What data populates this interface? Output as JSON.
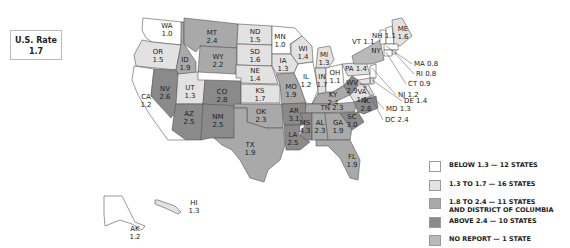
{
  "us_rate": {
    "label": "U.S. Rate",
    "value": "1.7"
  },
  "colors": {
    "below": "#ffffff",
    "low": "#e2e2e2",
    "mid": "#a9a9a9",
    "high": "#8a8a8a",
    "noreport": "#b9b9b9"
  },
  "legend": [
    {
      "key": "below",
      "label": "BELOW 1.3 — 12 STATES"
    },
    {
      "key": "low",
      "label": "1.3 TO 1.7 — 16 STATES"
    },
    {
      "key": "mid",
      "label": "1.8 TO 2.4 — 11 STATES",
      "label2": "AND DISTRICT OF COLUMBIA"
    },
    {
      "key": "high",
      "label": "ABOVE 2.4 — 10 STATES"
    },
    {
      "key": "noreport",
      "label": "NO REPORT — 1 STATE"
    }
  ],
  "states": [
    {
      "abbr": "WA",
      "value": "1.0",
      "cls": "below"
    },
    {
      "abbr": "OR",
      "value": "1.5",
      "cls": "low"
    },
    {
      "abbr": "CA",
      "value": "1.2",
      "cls": "below"
    },
    {
      "abbr": "ID",
      "value": "1.9",
      "cls": "mid"
    },
    {
      "abbr": "NV",
      "value": "2.6",
      "cls": "high"
    },
    {
      "abbr": "MT",
      "value": "2.4",
      "cls": "mid"
    },
    {
      "abbr": "WY",
      "value": "2.2",
      "cls": "mid"
    },
    {
      "abbr": "UT",
      "value": "1.3",
      "cls": "low"
    },
    {
      "abbr": "AZ",
      "value": "2.5",
      "cls": "high"
    },
    {
      "abbr": "CO",
      "value": "2.8",
      "cls": "high"
    },
    {
      "abbr": "NM",
      "value": "2.5",
      "cls": "high"
    },
    {
      "abbr": "ND",
      "value": "1.5",
      "cls": "low"
    },
    {
      "abbr": "SD",
      "value": "1.6",
      "cls": "low"
    },
    {
      "abbr": "NE",
      "value": "1.4",
      "cls": "low"
    },
    {
      "abbr": "KS",
      "value": "1.7",
      "cls": "low"
    },
    {
      "abbr": "OK",
      "value": "2.3",
      "cls": "mid"
    },
    {
      "abbr": "TX",
      "value": "1.9",
      "cls": "mid"
    },
    {
      "abbr": "MN",
      "value": "1.0",
      "cls": "below"
    },
    {
      "abbr": "IA",
      "value": "1.3",
      "cls": "low"
    },
    {
      "abbr": "MO",
      "value": "1.9",
      "cls": "mid"
    },
    {
      "abbr": "AR",
      "value": "3.1",
      "cls": "high"
    },
    {
      "abbr": "LA",
      "value": "2.5",
      "cls": "high"
    },
    {
      "abbr": "WI",
      "value": "1.4",
      "cls": "low"
    },
    {
      "abbr": "IL",
      "value": "1.2",
      "cls": "below"
    },
    {
      "abbr": "MI",
      "value": "1.3",
      "cls": "low"
    },
    {
      "abbr": "IN",
      "value": "1.7",
      "cls": "low"
    },
    {
      "abbr": "OH",
      "value": "1.1",
      "cls": "below"
    },
    {
      "abbr": "KY",
      "value": "2.4",
      "cls": "mid"
    },
    {
      "abbr": "TN",
      "value": "2.3",
      "cls": "mid"
    },
    {
      "abbr": "MS",
      "value": "4.3",
      "cls": "high"
    },
    {
      "abbr": "AL",
      "value": "2.3",
      "cls": "mid"
    },
    {
      "abbr": "GA",
      "value": "1.9",
      "cls": "mid"
    },
    {
      "abbr": "FL",
      "value": "1.9",
      "cls": "mid"
    },
    {
      "abbr": "SC",
      "value": "3.0",
      "cls": "high"
    },
    {
      "abbr": "NC",
      "value": "2.6",
      "cls": "high"
    },
    {
      "abbr": "VA",
      "value": "1.5",
      "cls": "low"
    },
    {
      "abbr": "WV",
      "value": "2.9",
      "cls": "high"
    },
    {
      "abbr": "PA",
      "value": "1.4",
      "cls": "low"
    },
    {
      "abbr": "NY",
      "value": "",
      "cls": "noreport"
    },
    {
      "abbr": "VT",
      "value": "1.1",
      "cls": "below"
    },
    {
      "abbr": "NH",
      "value": "1.1",
      "cls": "below"
    },
    {
      "abbr": "ME",
      "value": "1.6",
      "cls": "low"
    },
    {
      "abbr": "MA",
      "value": "0.8",
      "cls": "below"
    },
    {
      "abbr": "RI",
      "value": "0.8",
      "cls": "below"
    },
    {
      "abbr": "CT",
      "value": "0.9",
      "cls": "below"
    },
    {
      "abbr": "NJ",
      "value": "1.2",
      "cls": "below"
    },
    {
      "abbr": "DE",
      "value": "1.4",
      "cls": "low"
    },
    {
      "abbr": "MD",
      "value": "1.3",
      "cls": "low"
    },
    {
      "abbr": "DC",
      "value": "2.4",
      "cls": "mid"
    },
    {
      "abbr": "AK",
      "value": "1.2",
      "cls": "below"
    },
    {
      "abbr": "HI",
      "value": "1.3",
      "cls": "low"
    }
  ]
}
